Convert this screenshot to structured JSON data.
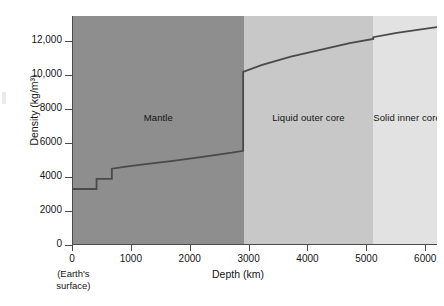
{
  "chart_data": {
    "type": "line",
    "title": "",
    "xlabel": "Depth (km)",
    "ylabel": "Density (kg/m³)",
    "xlim": [
      0,
      6200
    ],
    "ylim": [
      0,
      13500
    ],
    "xticks": [
      0,
      1000,
      2000,
      3000,
      4000,
      5000,
      6000
    ],
    "xticklabels": [
      "0",
      "1000",
      "2000",
      "3000",
      "4000",
      "5000",
      "6000"
    ],
    "yticks": [
      0,
      2000,
      4000,
      6000,
      8000,
      10000,
      12000
    ],
    "yticklabels": [
      "0",
      "2000",
      "4000",
      "6000",
      "8000",
      "10,000",
      "12,000"
    ],
    "grid": false,
    "legend": null,
    "annotations": [
      {
        "name": "origin-note",
        "text_line1": "(Earth's",
        "text_line2": "surface)",
        "x": 0
      }
    ],
    "regions": [
      {
        "name": "mantle",
        "label": "Mantle",
        "x_start": 0,
        "x_end": 2900,
        "color": "#8e8e8e"
      },
      {
        "name": "liquid-outer-core",
        "label": "Liquid outer core",
        "x_start": 2900,
        "x_end": 5100,
        "color": "#c8c8c8"
      },
      {
        "name": "solid-inner-core",
        "label": "Solid inner core",
        "x_start": 5100,
        "x_end": 6200,
        "color": "#e2e2e2"
      }
    ],
    "series": [
      {
        "name": "Density vs depth",
        "color": "#4a4a4a",
        "x": [
          0,
          400,
          400,
          660,
          660,
          900,
          1200,
          1700,
          2200,
          2700,
          2890,
          2890,
          3200,
          3700,
          4200,
          4700,
          5100,
          5100,
          5500,
          6000,
          6200
        ],
        "values": [
          3300,
          3300,
          3900,
          3900,
          4500,
          4620,
          4750,
          4960,
          5200,
          5440,
          5550,
          10200,
          10600,
          11100,
          11500,
          11900,
          12150,
          12250,
          12500,
          12750,
          12850
        ]
      }
    ]
  }
}
